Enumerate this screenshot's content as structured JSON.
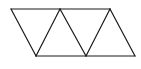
{
  "diagram": {
    "type": "triangle-strip",
    "triangle_count": 4,
    "stroke_color": "#1a1a1a",
    "background_color": "#ffffff"
  }
}
